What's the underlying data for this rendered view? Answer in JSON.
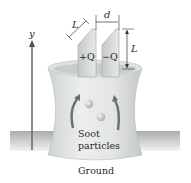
{
  "figure": {
    "axis": {
      "label": "y",
      "direction": "up"
    },
    "electrodes": {
      "left": {
        "charge_label": "+Q"
      },
      "right": {
        "charge_label": "−Q"
      },
      "width_label": "L",
      "height_label": "L",
      "separation_label": "d"
    },
    "stack": {
      "contents_label_line1": "Soot",
      "contents_label_line2": "particles"
    },
    "ground_label": "Ground",
    "colors": {
      "stack_fill": "#e4e6e7",
      "stack_shadow": "#c9cccd",
      "electrode_fill": "#d2d4d5",
      "ground_band": "#bdbfc0",
      "arrow": "#6b6e70",
      "text": "#2a2a2a",
      "particle": "#b8bbbd"
    }
  }
}
